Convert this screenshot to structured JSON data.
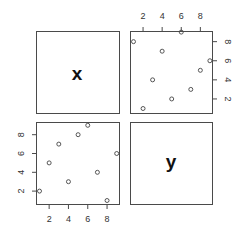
{
  "chart_data": {
    "type": "scatter",
    "title": "",
    "layout": "pairs-matrix-2x2",
    "variables": [
      "x",
      "y"
    ],
    "x": [
      1,
      2,
      3,
      4,
      5,
      6,
      7,
      8,
      9
    ],
    "y": [
      2,
      5,
      7,
      3,
      8,
      9,
      4,
      1,
      6
    ],
    "ticks": [
      2,
      4,
      6,
      8
    ],
    "axis_range": [
      1,
      9
    ],
    "grid": false,
    "legend": "none",
    "panels": [
      {
        "position": "top-left",
        "content": "label",
        "label": "x"
      },
      {
        "position": "top-right",
        "content": "scatter",
        "horizontal": "y",
        "vertical": "x",
        "axes": [
          "top",
          "right"
        ]
      },
      {
        "position": "bottom-left",
        "content": "scatter",
        "horizontal": "x",
        "vertical": "y",
        "axes": [
          "left",
          "bottom"
        ]
      },
      {
        "position": "bottom-right",
        "content": "label",
        "label": "y"
      }
    ]
  },
  "labels": {
    "var1": "x",
    "var2": "y",
    "tick_labels": [
      "2",
      "4",
      "6",
      "8"
    ]
  }
}
